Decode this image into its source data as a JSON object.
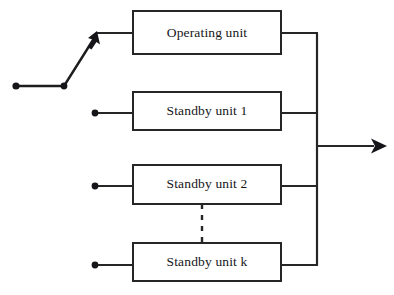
{
  "diagram": {
    "type": "block-diagram",
    "colors": {
      "stroke": "#262626",
      "text": "#16161a",
      "background": "#ffffff"
    },
    "blocks": [
      {
        "id": "operating-unit",
        "label": "Operating unit",
        "x": 133,
        "y": 11,
        "width": 148,
        "height": 43
      },
      {
        "id": "standby-unit-1",
        "label": "Standby unit 1",
        "x": 133,
        "y": 92,
        "width": 148,
        "height": 38
      },
      {
        "id": "standby-unit-2",
        "label": "Standby unit 2",
        "x": 133,
        "y": 165,
        "width": 148,
        "height": 39
      },
      {
        "id": "standby-unit-k",
        "label": "Standby unit k",
        "x": 133,
        "y": 243,
        "width": 148,
        "height": 38
      }
    ],
    "switch": {
      "name": "input-switch",
      "terminal_dot": {
        "x": 16,
        "y": 86
      },
      "pivot_dot": {
        "x": 64,
        "y": 86
      },
      "arrow_tip": {
        "x": 97,
        "y": 33
      },
      "state": "connected-to-operating-unit"
    },
    "input_terminals": [
      {
        "for": "standby-unit-1",
        "x": 95,
        "y": 113
      },
      {
        "for": "standby-unit-2",
        "x": 95,
        "y": 186
      },
      {
        "for": "standby-unit-k",
        "x": 95,
        "y": 265
      }
    ],
    "bus": {
      "name": "output-bus",
      "x": 317,
      "y_top": 33,
      "y_bottom": 265
    },
    "output_arrow": {
      "name": "output-arrow",
      "x_start": 317,
      "x_end": 385,
      "y": 146
    },
    "continuation": {
      "name": "units-continuation-dashes",
      "x": 202,
      "y_top": 204,
      "y_bottom": 243
    }
  }
}
